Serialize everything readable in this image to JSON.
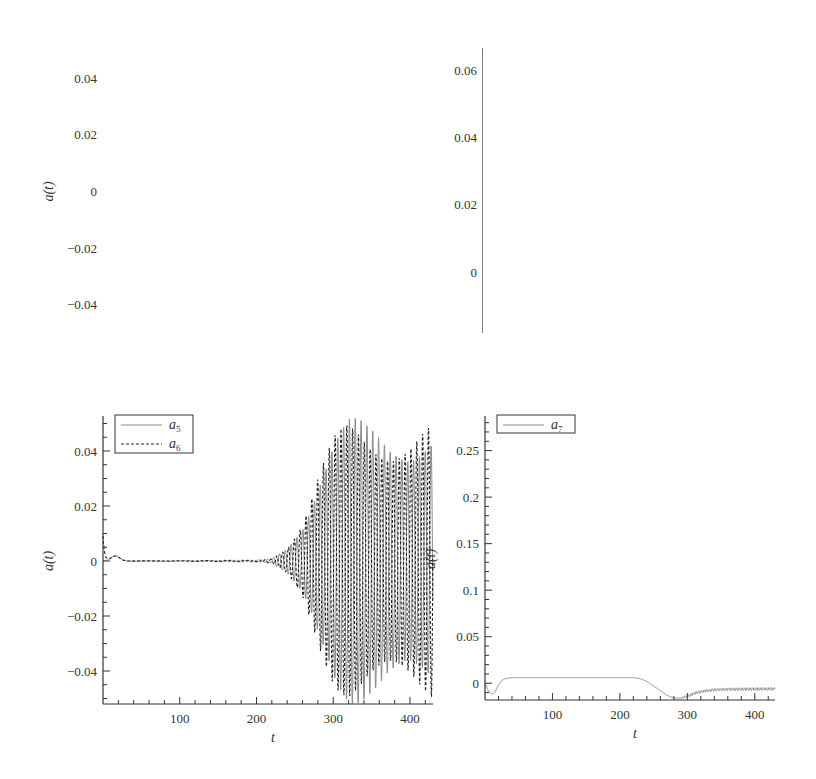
{
  "chart_data": [
    {
      "type": "line",
      "panel": "top-left",
      "xlabel": "t",
      "ylabel": "a(t)",
      "xlim": [
        0,
        430
      ],
      "ylim": [
        -0.05,
        0.05
      ],
      "xticks": [
        100,
        200,
        300,
        400
      ],
      "yticks": [
        -0.04,
        -0.02,
        0,
        0.02,
        0.04
      ],
      "ytick_labels": [
        "−0.04",
        "−0.02",
        "0",
        "0.02",
        "0.04"
      ],
      "legend": [
        {
          "name": "a",
          "sub": "1",
          "style": "solid"
        },
        {
          "name": "a",
          "sub": "2",
          "style": "dashed"
        }
      ],
      "legend_position": "upper left",
      "series": [
        {
          "name": "a1",
          "style": "solid",
          "description": "near 0 until t~180, oscillation grows from t~200 to envelope ~0.05 by t~310, saturated until 430",
          "envelope": [
            [
              0,
              0.001
            ],
            [
              150,
              0.001
            ],
            [
              180,
              0.002
            ],
            [
              200,
              0.004
            ],
            [
              230,
              0.012
            ],
            [
              260,
              0.028
            ],
            [
              290,
              0.045
            ],
            [
              310,
              0.05
            ],
            [
              430,
              0.05
            ]
          ]
        },
        {
          "name": "a2",
          "style": "dashed",
          "description": "same envelope as a1, phase-shifted",
          "envelope": [
            [
              0,
              0.001
            ],
            [
              150,
              0.002
            ],
            [
              180,
              0.003
            ],
            [
              200,
              0.005
            ],
            [
              230,
              0.013
            ],
            [
              260,
              0.03
            ],
            [
              290,
              0.046
            ],
            [
              310,
              0.05
            ],
            [
              430,
              0.05
            ]
          ]
        }
      ],
      "frame": {
        "x0": 103,
        "x1": 433,
        "y_top": 50,
        "y_bottom": 333
      }
    },
    {
      "type": "line",
      "panel": "top-right",
      "xlabel": "t",
      "ylabel": "a(t)",
      "xlim": [
        0,
        430
      ],
      "ylim": [
        -0.018,
        0.066
      ],
      "xticks": [
        100,
        200,
        300,
        400
      ],
      "yticks": [
        0,
        0.02,
        0.04,
        0.06
      ],
      "ytick_labels": [
        "0",
        "0.02",
        "0.04",
        "0.06"
      ],
      "legend": [
        {
          "name": "a",
          "sub": "3",
          "style": "solid"
        }
      ],
      "legend_position": "upper left",
      "series": [
        {
          "name": "a3",
          "style": "solid",
          "description": "starts ~0.066, decays to ~-0.018 by t~55, flat until t~220, rises in staircase to ~0.026 by t~320, then oscillates ~0.025-0.028",
          "points": [
            [
              0,
              0.066
            ],
            [
              5,
              0.05
            ],
            [
              10,
              0.032
            ],
            [
              15,
              0.018
            ],
            [
              20,
              0.007
            ],
            [
              25,
              0.0
            ],
            [
              30,
              -0.007
            ],
            [
              35,
              -0.012
            ],
            [
              40,
              -0.015
            ],
            [
              50,
              -0.0175
            ],
            [
              60,
              -0.018
            ],
            [
              220,
              -0.018
            ],
            [
              230,
              -0.016
            ],
            [
              240,
              -0.012
            ],
            [
              250,
              -0.005
            ],
            [
              260,
              0.003
            ],
            [
              270,
              0.011
            ],
            [
              280,
              0.017
            ],
            [
              290,
              0.021
            ],
            [
              300,
              0.023
            ],
            [
              310,
              0.025
            ],
            [
              320,
              0.026
            ],
            [
              340,
              0.0265
            ],
            [
              430,
              0.0265
            ]
          ],
          "oscillation": {
            "from": 300,
            "amplitude": 0.0015,
            "period": 7
          }
        }
      ],
      "frame": {
        "x0": 483,
        "x1": 775,
        "y_top": 50,
        "y_bottom": 333
      }
    },
    {
      "type": "line",
      "panel": "bottom-left",
      "xlabel": "t",
      "ylabel": "a(t)",
      "xlim": [
        0,
        430
      ],
      "ylim": [
        -0.052,
        0.052
      ],
      "xticks": [
        100,
        200,
        300,
        400
      ],
      "yticks": [
        -0.04,
        -0.02,
        0,
        0.02,
        0.04
      ],
      "ytick_labels": [
        "−0.04",
        "−0.02",
        "0",
        "0.02",
        "0.04"
      ],
      "legend": [
        {
          "name": "a",
          "sub": "5",
          "style": "solid"
        },
        {
          "name": "a",
          "sub": "6",
          "style": "dashed"
        }
      ],
      "legend_position": "upper left",
      "series": [
        {
          "name": "a5",
          "style": "solid",
          "description": "small bump ~0.002 near t~15, ~0 until t~220, oscillation grows to envelope ~0.052 by t~320",
          "envelope": [
            [
              0,
              0.0
            ],
            [
              200,
              0.0003
            ],
            [
              220,
              0.001
            ],
            [
              240,
              0.006
            ],
            [
              260,
              0.016
            ],
            [
              280,
              0.032
            ],
            [
              300,
              0.045
            ],
            [
              320,
              0.052
            ],
            [
              430,
              0.052
            ]
          ]
        },
        {
          "name": "a6",
          "style": "dashed",
          "description": "initial spike ~0.01 at t~0, then same as a5",
          "envelope": [
            [
              0,
              0.0
            ],
            [
              200,
              0.0003
            ],
            [
              220,
              0.001
            ],
            [
              240,
              0.006
            ],
            [
              260,
              0.016
            ],
            [
              280,
              0.032
            ],
            [
              300,
              0.045
            ],
            [
              320,
              0.052
            ],
            [
              430,
              0.052
            ]
          ]
        }
      ],
      "frame": {
        "x0": 103,
        "x1": 433,
        "y_top": 418,
        "y_bottom": 704
      }
    },
    {
      "type": "line",
      "panel": "bottom-right",
      "xlabel": "t",
      "ylabel": "a(t)",
      "xlim": [
        0,
        430
      ],
      "ylim": [
        -0.018,
        0.285
      ],
      "xticks": [
        100,
        200,
        300,
        400
      ],
      "yticks": [
        0,
        0.05,
        0.1,
        0.15,
        0.2,
        0.25
      ],
      "ytick_labels": [
        "0",
        "0.05",
        "0.1",
        "0.15",
        "0.2",
        "0.25"
      ],
      "legend": [
        {
          "name": "a",
          "sub": "7",
          "style": "solid"
        }
      ],
      "legend_position": "upper left",
      "series": [
        {
          "name": "a7",
          "style": "solid",
          "description": "dips to ~-0.012 at t~10, rises to ~0.006 by t~35, flat until t~230, declines to ~-0.016 at t~285, recovers with small oscillation to ~-0.006",
          "points": [
            [
              0,
              0.0
            ],
            [
              5,
              -0.008
            ],
            [
              10,
              -0.012
            ],
            [
              15,
              -0.009
            ],
            [
              20,
              -0.002
            ],
            [
              25,
              0.003
            ],
            [
              30,
              0.005
            ],
            [
              40,
              0.006
            ],
            [
              220,
              0.006
            ],
            [
              230,
              0.005
            ],
            [
              240,
              0.002
            ],
            [
              250,
              -0.003
            ],
            [
              260,
              -0.008
            ],
            [
              270,
              -0.013
            ],
            [
              280,
              -0.016
            ],
            [
              290,
              -0.016
            ],
            [
              300,
              -0.014
            ],
            [
              310,
              -0.011
            ],
            [
              320,
              -0.009
            ],
            [
              340,
              -0.007
            ],
            [
              360,
              -0.0065
            ],
            [
              430,
              -0.006
            ]
          ],
          "oscillation": {
            "from": 280,
            "amplitude": 0.0015,
            "period": 4
          }
        }
      ],
      "frame": {
        "x0": 485,
        "x1": 775,
        "y_top": 418,
        "y_bottom": 700
      }
    }
  ],
  "colors": {
    "axis": "#333333",
    "line_solid": "#8a8a8a",
    "line_dashed": "#222222",
    "text": "#333333"
  }
}
